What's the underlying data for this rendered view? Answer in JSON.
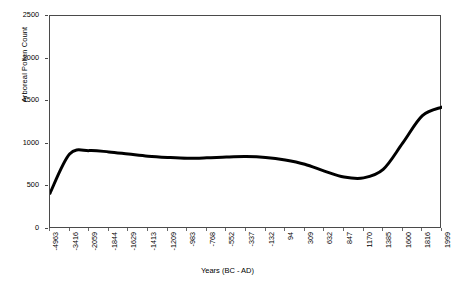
{
  "chart_data": {
    "type": "line",
    "title": "",
    "xlabel": "Years (BC - AD)",
    "ylabel": "Arboreal Pollen Count",
    "ylim": [
      0,
      2500
    ],
    "yticks": [
      0,
      500,
      1000,
      1500,
      2000,
      2500
    ],
    "grid": false,
    "legend": "none",
    "categories": [
      "-4963",
      "-3416",
      "-2059",
      "-1844",
      "-1629",
      "-1413",
      "-1209",
      "-983",
      "-768",
      "-552",
      "-337",
      "-132",
      "94",
      "309",
      "632",
      "847",
      "1170",
      "1385",
      "1600",
      "1816",
      "1999"
    ],
    "values": [
      420,
      880,
      920,
      905,
      880,
      855,
      840,
      830,
      835,
      845,
      850,
      840,
      810,
      760,
      680,
      610,
      600,
      700,
      1010,
      1330,
      1430
    ],
    "series": [
      {
        "name": "Arboreal Pollen Count",
        "color": "#000000",
        "values": [
          420,
          880,
          920,
          905,
          880,
          855,
          840,
          830,
          835,
          845,
          850,
          840,
          810,
          760,
          680,
          610,
          600,
          700,
          1010,
          1330,
          1430
        ]
      }
    ],
    "x_tick_labels": [
      "-4963",
      "-3416",
      "-2059",
      "-1844",
      "-1629",
      "-1413",
      "-1209",
      "-983",
      "-768",
      "-552",
      "-337",
      "-132",
      "94",
      "309",
      "632",
      "847",
      "1170",
      "1385",
      "1600",
      "1816",
      "1999"
    ],
    "y_tick_labels": [
      "0",
      "500",
      "1000",
      "1500",
      "2000",
      "2500"
    ],
    "line_width": 3,
    "axis_color": "#4a4a4a"
  }
}
